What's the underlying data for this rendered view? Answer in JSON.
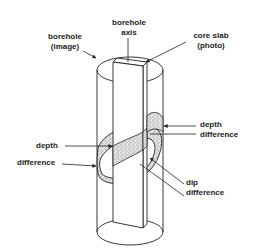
{
  "figure": {
    "labels": {
      "borehole_image": {
        "line1": "borehole",
        "line2": "(image)"
      },
      "borehole_axis": {
        "line1": "borehole",
        "line2": "axis"
      },
      "core_slab": {
        "line1": "core slab",
        "line2": "(photo)"
      },
      "depth_difference_right": {
        "line1": "depth",
        "line2": "difference"
      },
      "depth_difference_left": {
        "line1": "depth",
        "line2": "difference"
      },
      "dip_difference": {
        "line1": "dip",
        "line2": "difference"
      }
    },
    "colors": {
      "stroke": "#222222",
      "bed_fill": "#d8d8d8",
      "background": "#ffffff"
    }
  }
}
